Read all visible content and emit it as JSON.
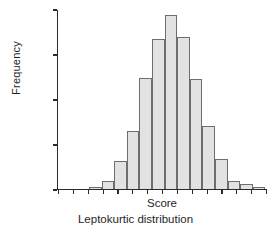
{
  "chart_data": {
    "type": "bar",
    "title": "",
    "subtitle": "Leptokurtic distribution",
    "xlabel": "Score",
    "ylabel": "Frequency",
    "ylim": [
      0,
      2000
    ],
    "yticks": [
      0,
      500,
      1000,
      1500,
      2000
    ],
    "ytick_labels": [
      "0",
      "500",
      "1000",
      "1500",
      "2000"
    ],
    "grid": false,
    "legend": null,
    "xtick_count": 15,
    "xtick_labels": [],
    "categories": [
      "b1",
      "b2",
      "b3",
      "b4",
      "b5",
      "b6",
      "b7",
      "b8",
      "b9",
      "b10",
      "b11",
      "b12",
      "b13",
      "b14"
    ],
    "values": [
      30,
      90,
      320,
      650,
      1240,
      1670,
      1940,
      1690,
      1225,
      700,
      340,
      90,
      55,
      25
    ],
    "bar_fill_color": "#e2e2e2",
    "bar_edge_color": "#6e6e6e",
    "axis_color": "#2b2b2b",
    "bar_left_fraction": [
      0.152,
      0.212,
      0.272,
      0.332,
      0.392,
      0.452,
      0.512,
      0.572,
      0.632,
      0.692,
      0.752,
      0.812,
      0.872,
      0.932
    ],
    "bar_width_fraction": 0.06
  },
  "figure": {
    "ylabel": "Frequency",
    "xlabel": "Score",
    "caption": "Leptokurtic distribution"
  }
}
